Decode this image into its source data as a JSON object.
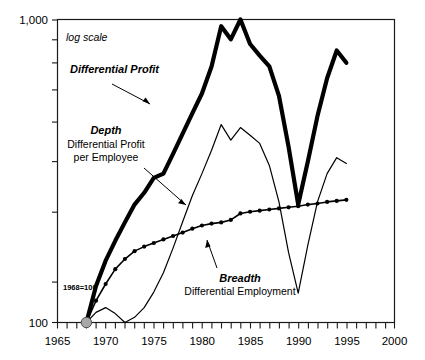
{
  "chart_data": {
    "type": "line",
    "title": "",
    "subtitle": "",
    "xlabel": "",
    "ylabel": "",
    "scale_note": "log scale",
    "base_note": "1968=100",
    "yscale": "log",
    "ylim": [
      100,
      1000
    ],
    "xlim": [
      1965,
      2000
    ],
    "ytick_labels": [
      "1,000",
      "100"
    ],
    "ytick_values": [
      1000,
      100
    ],
    "xtick_labels": [
      "1965",
      "1970",
      "1975",
      "1980",
      "1985",
      "1990",
      "1995",
      "2000"
    ],
    "xtick_values": [
      1965,
      1970,
      1975,
      1980,
      1985,
      1990,
      1995,
      2000
    ],
    "x_minor_tick_step": 1,
    "grid": false,
    "legend_position": "inline-annotations",
    "series": [
      {
        "name": "Differential Profit",
        "style": "thick-line",
        "x": [
          1968,
          1969,
          1970,
          1971,
          1972,
          1973,
          1974,
          1975,
          1976,
          1977,
          1978,
          1979,
          1980,
          1981,
          1982,
          1983,
          1984,
          1985,
          1986,
          1987,
          1988,
          1989,
          1990,
          1991,
          1992,
          1993,
          1994,
          1995
        ],
        "values": [
          100,
          132,
          160,
          186,
          214,
          245,
          268,
          300,
          310,
          360,
          420,
          490,
          570,
          700,
          950,
          860,
          1000,
          830,
          760,
          700,
          560,
          380,
          245,
          340,
          480,
          640,
          790,
          720
        ]
      },
      {
        "name": "Depth — Differential Profit per Employee",
        "style": "thin-line",
        "x": [
          1968,
          1969,
          1970,
          1971,
          1972,
          1973,
          1974,
          1975,
          1976,
          1977,
          1978,
          1979,
          1980,
          1981,
          1982,
          1983,
          1984,
          1985,
          1986,
          1987,
          1988,
          1989,
          1990,
          1991,
          1992,
          1993,
          1994,
          1995
        ],
        "values": [
          100,
          108,
          112,
          107,
          100,
          104,
          112,
          126,
          146,
          176,
          215,
          262,
          310,
          370,
          450,
          400,
          440,
          415,
          390,
          330,
          250,
          170,
          125,
          180,
          250,
          310,
          350,
          335
        ]
      },
      {
        "name": "Breadth — Differential Employment",
        "style": "marked-line",
        "x": [
          1968,
          1969,
          1970,
          1971,
          1972,
          1973,
          1974,
          1975,
          1976,
          1977,
          1978,
          1979,
          1980,
          1981,
          1982,
          1983,
          1984,
          1985,
          1986,
          1987,
          1988,
          1989,
          1990,
          1991,
          1992,
          1993,
          1994,
          1995
        ],
        "values": [
          100,
          118,
          134,
          150,
          162,
          172,
          178,
          183,
          188,
          193,
          198,
          204,
          209,
          212,
          214,
          218,
          229,
          232,
          234,
          236,
          238,
          240,
          242,
          245,
          247,
          250,
          252,
          254
        ]
      }
    ],
    "annotations": [
      {
        "id": "differential-profit",
        "title": "Differential Profit",
        "subtitle": ""
      },
      {
        "id": "depth",
        "title": "Depth",
        "subtitle_line1": "Differential Profit",
        "subtitle_line2": "per Employee"
      },
      {
        "id": "breadth",
        "title": "Breadth",
        "subtitle": "Differential Employment"
      }
    ]
  },
  "colors": {
    "line": "#000000",
    "frame": "#1a1a1a",
    "origin_marker": "#a8a8a8",
    "background": "#ffffff"
  }
}
